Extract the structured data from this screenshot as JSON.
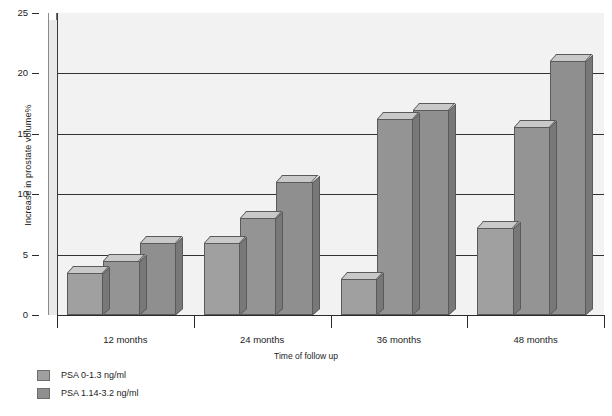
{
  "chart_data": {
    "type": "bar",
    "title": "",
    "xlabel": "Time of follow up",
    "ylabel": "Increase in prostate volume%",
    "categories": [
      "12 months",
      "24 months",
      "36 months",
      "48 months"
    ],
    "ylim": [
      0,
      25
    ],
    "y_ticks": [
      0,
      5,
      10,
      15,
      20,
      25
    ],
    "grid": true,
    "legend_position": "below-left",
    "style": "3d-column",
    "series": [
      {
        "name": "PSA 0-1.3 ng/ml",
        "color": "#a0a0a0",
        "values": [
          3.5,
          6.0,
          3.0,
          7.2
        ]
      },
      {
        "name": "PSA 1.14-3.2 ng/ml",
        "color": "#949494",
        "values": [
          4.5,
          8.0,
          16.2,
          15.6
        ]
      },
      {
        "name": "",
        "color": "#8f8f8f",
        "values": [
          6.0,
          11.0,
          17.0,
          21.0
        ]
      }
    ]
  },
  "axes": {
    "y_title": "Increase in prostate volume%",
    "x_title": "Time of follow up",
    "y_labels": [
      "25",
      "20",
      "15",
      "10",
      "5",
      "0"
    ],
    "x_labels": [
      "12 months",
      "24 months",
      "36 months",
      "48 months"
    ]
  },
  "legend": {
    "entries": [
      {
        "label": "PSA 0-1.3 ng/ml",
        "color": "#a0a0a0"
      },
      {
        "label": "PSA 1.14-3.2 ng/ml",
        "color": "#8f8f8f"
      }
    ]
  },
  "colors": {
    "plot_background": "#f2f2f2",
    "wall": "#e9e9e9",
    "gridline": "#333333",
    "axis": "#2b2b2b",
    "bar_outline": "#5a5a5a",
    "bar_top_face": "#c9c9c9",
    "bar_side_face": "#787878",
    "text": "#1c1c1c"
  }
}
